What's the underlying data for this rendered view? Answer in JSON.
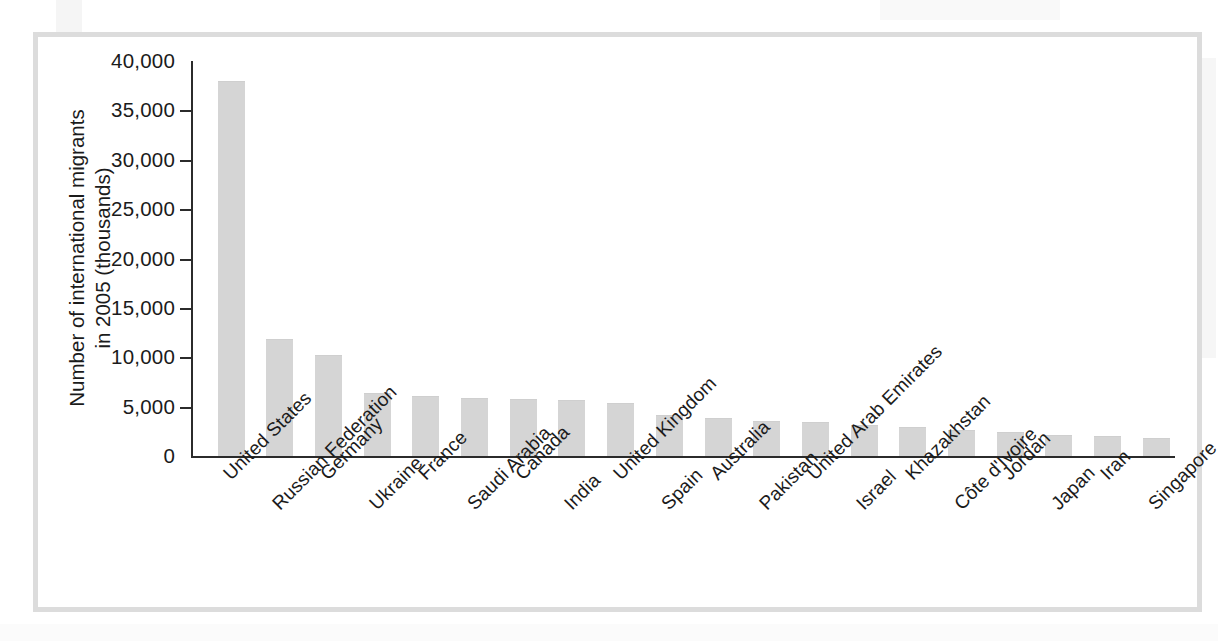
{
  "figure": {
    "frame_color": "#dcdcdc",
    "background_color": "#ffffff",
    "bar_color": "#d5d5d5",
    "axis_color": "#2b2b2b"
  },
  "chart_data": {
    "type": "bar",
    "title": "",
    "subtitle": "",
    "xlabel": "",
    "ylabel_line1": "Number of international migrants",
    "ylabel_line2": "in 2005 (thousands)",
    "ylim": [
      0,
      40000
    ],
    "ytick_labels": [
      "40,000",
      "35,000",
      "30,000",
      "25,000",
      "20,000",
      "15,000",
      "10,000",
      "5,000",
      "0"
    ],
    "ytick_values": [
      40000,
      35000,
      30000,
      25000,
      20000,
      15000,
      10000,
      5000,
      0
    ],
    "grid": false,
    "legend": false,
    "legend_position": "none",
    "categories": [
      "United States",
      "Russian Federation",
      "Germany",
      "Ukraine",
      "France",
      "Saudi Arabia",
      "Canada",
      "India",
      "United Kingdom",
      "Spain",
      "Australia",
      "Pakistan",
      "United Arab Emirates",
      "Israel",
      "Khazakhstan",
      "Côte d'Ivoire",
      "Jordan",
      "Japan",
      "Iran",
      "Singapore"
    ],
    "values": [
      38000,
      11800,
      10200,
      6400,
      6100,
      5850,
      5750,
      5700,
      5400,
      4200,
      3900,
      3500,
      3450,
      3100,
      2900,
      2650,
      2400,
      2150,
      2000,
      1800
    ]
  }
}
